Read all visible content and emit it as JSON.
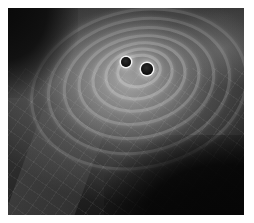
{
  "image": {
    "subject": "binary black hole merger emitting gravitational waves",
    "palette": {
      "background_border": "#ffffff",
      "dark": "#0a0a0a",
      "mid": "#555555",
      "light_glow": "#e0e0e0",
      "black_hole": "#111111"
    },
    "black_holes": [
      {
        "name": "black-hole-left",
        "cx": 118,
        "cy": 54,
        "r": 5
      },
      {
        "name": "black-hole-right",
        "cx": 139,
        "cy": 61,
        "r": 6
      }
    ],
    "rings": [
      {
        "w": 40,
        "h": 28
      },
      {
        "w": 64,
        "h": 46
      },
      {
        "w": 90,
        "h": 64
      },
      {
        "w": 118,
        "h": 84
      },
      {
        "w": 148,
        "h": 106
      },
      {
        "w": 180,
        "h": 130
      },
      {
        "w": 214,
        "h": 154
      }
    ]
  }
}
